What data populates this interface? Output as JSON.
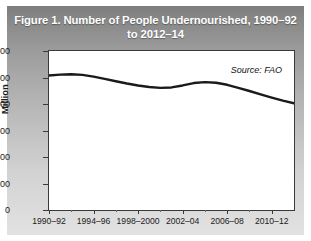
{
  "figure": {
    "title": "Figure 1. Number of People Undernourished, 1990–92 to 2012–14",
    "title_line1": "Figure 1. Number of People Undernourished, 1990–92",
    "title_line2": "to 2012–14",
    "source_note": "Source: FAO",
    "title_band_color": "#9a9a9a",
    "panel_color": "#ffffff",
    "line_color": "#1a1a1a"
  },
  "chart_data": {
    "type": "line",
    "title": "Figure 1. Number of People Undernourished, 1990–92 to 2012–14",
    "xlabel": "",
    "ylabel": "Million",
    "ylim": [
      0,
      1200
    ],
    "yticks": [
      0,
      200,
      400,
      600,
      800,
      1000,
      1200
    ],
    "ytick_labels": [
      "0",
      "200",
      "400",
      "600",
      "800",
      "1000",
      "1200"
    ],
    "xtick_labels": [
      "1990–92",
      "1994–96",
      "1998–2000",
      "2002–04",
      "2006–08",
      "2010–12"
    ],
    "xtick_positions": [
      1991,
      1995,
      1999,
      2003,
      2007,
      2011
    ],
    "xlim": [
      1991,
      2013
    ],
    "grid": false,
    "legend": null,
    "annotations": [
      "Source: FAO"
    ],
    "series": [
      {
        "name": "Number of people undernourished",
        "unit": "Million",
        "x": [
          1991,
          1992,
          1993,
          1994,
          1995,
          1996,
          1997,
          1998,
          1999,
          2000,
          2001,
          2002,
          2003,
          2004,
          2005,
          2006,
          2007,
          2008,
          2009,
          2010,
          2011,
          2012,
          2013
        ],
        "values": [
          1015,
          1022,
          1025,
          1020,
          1007,
          990,
          972,
          955,
          940,
          928,
          922,
          925,
          940,
          958,
          965,
          960,
          945,
          922,
          898,
          872,
          848,
          825,
          805
        ]
      }
    ]
  }
}
